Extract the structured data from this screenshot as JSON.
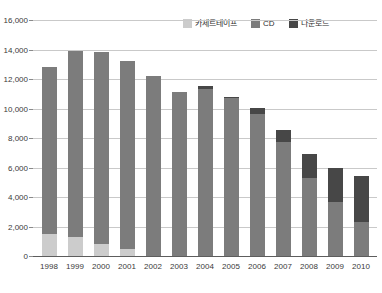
{
  "chart_data": {
    "type": "bar",
    "stacked": true,
    "title": "",
    "subtitle": "",
    "xlabel": "",
    "ylabel": "",
    "categories": [
      "1998",
      "1999",
      "2000",
      "2001",
      "2002",
      "2003",
      "2004",
      "2005",
      "2006",
      "2007",
      "2008",
      "2009",
      "2010"
    ],
    "series": [
      {
        "name": "카세트테이프",
        "color": "#cccccc",
        "values": [
          1500,
          1300,
          800,
          500,
          0,
          0,
          0,
          0,
          0,
          0,
          0,
          0,
          0
        ]
      },
      {
        "name": "CD",
        "color": "#7c7c7c",
        "values": [
          11300,
          12600,
          13050,
          12700,
          12200,
          11150,
          11350,
          10700,
          9600,
          7700,
          5300,
          3650,
          2300
        ]
      },
      {
        "name": "다운로드",
        "color": "#474747",
        "values": [
          0,
          0,
          0,
          0,
          0,
          0,
          150,
          100,
          450,
          850,
          1600,
          2350,
          3100
        ]
      }
    ],
    "totals": [
      12800,
      13900,
      13850,
      13200,
      12200,
      11150,
      11500,
      10800,
      10050,
      8550,
      6900,
      6000,
      5400
    ],
    "ylim": [
      0,
      16000
    ],
    "yticks": [
      "0",
      "2,000",
      "4,000",
      "6,000",
      "8,000",
      "10,000",
      "12,000",
      "14,000",
      "16,000"
    ],
    "ytick_values": [
      0,
      2000,
      4000,
      6000,
      8000,
      10000,
      12000,
      14000,
      16000
    ],
    "grid": true,
    "legend_position": "top-right"
  },
  "legend": {
    "items": [
      {
        "label": "카세트테이프",
        "color": "#cccccc",
        "name": "legend-cassette"
      },
      {
        "label": "CD",
        "color": "#7c7c7c",
        "name": "legend-cd"
      },
      {
        "label": "다운로드",
        "color": "#474747",
        "name": "legend-download"
      }
    ]
  }
}
